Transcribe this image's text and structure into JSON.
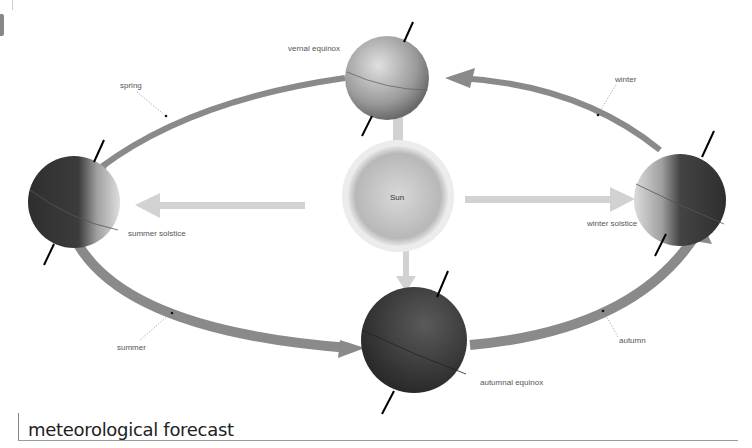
{
  "diagram": {
    "title": "meteorological forecast",
    "center": {
      "label": "Sun"
    },
    "positions": [
      {
        "id": "vernal",
        "label": "vernal equinox"
      },
      {
        "id": "summer-solstice",
        "label": "summer solstice"
      },
      {
        "id": "autumnal",
        "label": "autumnal equinox"
      },
      {
        "id": "winter-solstice",
        "label": "winter solstice"
      }
    ],
    "seasons": [
      {
        "id": "spring",
        "label": "spring"
      },
      {
        "id": "summer",
        "label": "summer"
      },
      {
        "id": "autumn",
        "label": "autumn"
      },
      {
        "id": "winter",
        "label": "winter"
      }
    ],
    "colors": {
      "orbit": "#8a8a8a",
      "sunlight_arrow": "#d4d4d4",
      "sun": "#c8c8c8",
      "earth_dark": "#3a3a3a",
      "earth_light": "#bdbdbd"
    }
  }
}
